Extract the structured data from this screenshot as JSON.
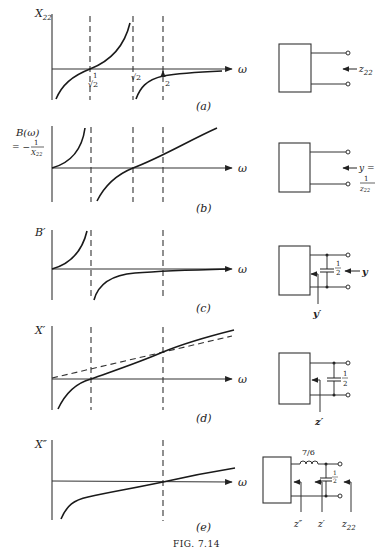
{
  "figure": {
    "caption": "FIG. 7.14",
    "x_axis_symbol": "ω"
  },
  "panels": [
    {
      "id": "a",
      "label": "(a)",
      "y_label": "X22",
      "y_label_base": "X",
      "y_label_sub": "22",
      "tick_labels": [
        "1/√2",
        "√2",
        "2"
      ],
      "tick_1_num": "1",
      "tick_1_den": "√2",
      "tick_2": "√2",
      "tick_3": "2",
      "network_port_label_base": "z",
      "network_port_label_sub": "22"
    },
    {
      "id": "b",
      "label": "(b)",
      "y_label_line1": "B(ω)",
      "y_label_line2_prefix": "= −",
      "y_label_frac_num": "1",
      "y_label_frac_den_base": "X",
      "y_label_frac_den_sub": "22",
      "network_port_label": "y =",
      "network_frac_num": "1",
      "network_frac_den_base": "z",
      "network_frac_den_sub": "22"
    },
    {
      "id": "c",
      "label": "(c)",
      "y_label": "B′",
      "capacitor_num": "1",
      "capacitor_den": "2",
      "outer_port_label": "y",
      "inner_port_label": "y′"
    },
    {
      "id": "d",
      "label": "(d)",
      "y_label": "X′",
      "capacitor_num": "1",
      "capacitor_den": "2",
      "inner_port_label": "z′"
    },
    {
      "id": "e",
      "label": "(e)",
      "y_label": "X″",
      "inductor_value": "7/6",
      "capacitor_num": "1",
      "capacitor_den": "2",
      "port_labels": [
        "z″",
        "z′",
        "z22"
      ],
      "port_1": "z″",
      "port_2": "z′",
      "port_3_base": "z",
      "port_3_sub": "22"
    }
  ]
}
